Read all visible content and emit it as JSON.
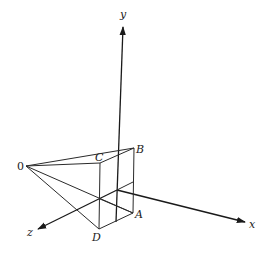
{
  "diagram": {
    "type": "3d-coordinate-perspective",
    "axes": {
      "x": {
        "label": "x"
      },
      "y": {
        "label": "y"
      },
      "z": {
        "label": "z"
      }
    },
    "points": {
      "O": {
        "label": "0"
      },
      "A": {
        "label": "A"
      },
      "B": {
        "label": "B"
      },
      "C": {
        "label": "C"
      },
      "D": {
        "label": "D"
      }
    },
    "colors": {
      "line": "#2a2a2a",
      "background": "#ffffff"
    }
  }
}
